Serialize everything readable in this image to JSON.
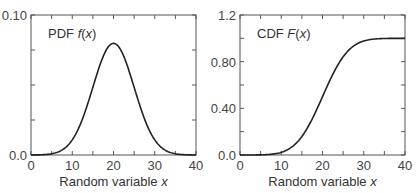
{
  "chart_data": [
    {
      "type": "line",
      "title": "",
      "panel_label": "PDF",
      "panel_func": "f(x)",
      "xlabel": "Random variable",
      "xlabel_var": "x",
      "ylabel": "",
      "xlim": [
        0,
        40
      ],
      "ylim": [
        0.0,
        0.1
      ],
      "xticks": [
        0,
        10,
        20,
        30,
        40
      ],
      "xtick_labels": [
        "0",
        "10",
        "20",
        "30",
        "40"
      ],
      "yticks_labeled": [
        0.0,
        0.1
      ],
      "ytick_labels": [
        "0.0",
        "0.10"
      ],
      "grid": false,
      "series": [
        {
          "name": "PDF f(x) (normal, mean 20, sd 5)",
          "x": [
            0,
            5,
            8,
            10,
            12,
            14,
            16,
            18,
            20,
            22,
            24,
            26,
            28,
            30,
            32,
            35,
            40
          ],
          "y": [
            0.0,
            0.0009,
            0.0045,
            0.0108,
            0.0222,
            0.0389,
            0.0579,
            0.0737,
            0.0798,
            0.0737,
            0.0579,
            0.0389,
            0.0222,
            0.0108,
            0.0045,
            0.0009,
            0.0
          ]
        }
      ]
    },
    {
      "type": "line",
      "title": "",
      "panel_label": "CDF",
      "panel_func": "F(x)",
      "xlabel": "Random variable",
      "xlabel_var": "x",
      "ylabel": "",
      "xlim": [
        0,
        40
      ],
      "ylim": [
        0.0,
        1.2
      ],
      "xticks": [
        0,
        10,
        20,
        30,
        40
      ],
      "xtick_labels": [
        "0",
        "10",
        "20",
        "30",
        "40"
      ],
      "yticks_labeled": [
        0.0,
        0.4,
        0.8,
        1.2
      ],
      "ytick_labels": [
        "0.0",
        "0.40",
        "0.80",
        "1.2"
      ],
      "grid": false,
      "series": [
        {
          "name": "CDF F(x) (normal, mean 20, sd 5)",
          "x": [
            0,
            5,
            8,
            10,
            12,
            14,
            16,
            18,
            20,
            22,
            24,
            26,
            28,
            30,
            32,
            35,
            40
          ],
          "y": [
            0.0,
            0.0013,
            0.0082,
            0.0228,
            0.0548,
            0.1151,
            0.2119,
            0.3446,
            0.5,
            0.6554,
            0.7881,
            0.8849,
            0.9452,
            0.9772,
            0.9918,
            0.9987,
            1.0
          ]
        }
      ]
    }
  ]
}
